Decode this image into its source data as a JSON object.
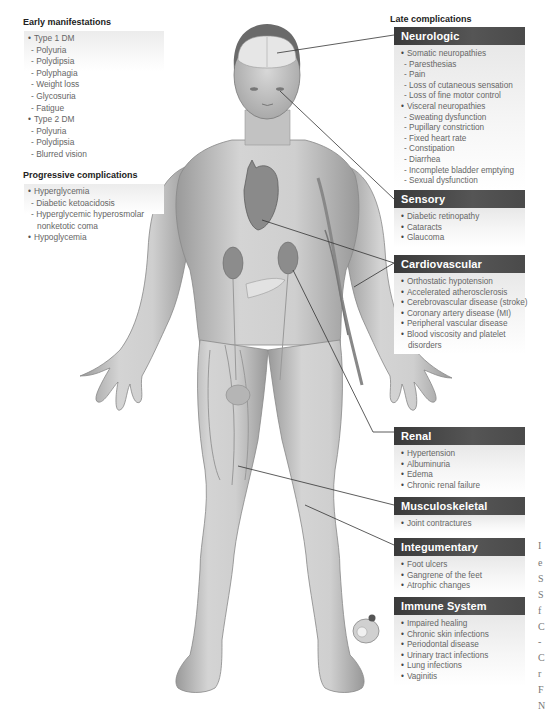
{
  "early": {
    "title": "Early manifestations",
    "items": [
      {
        "kind": "b",
        "text": "Type 1 DM"
      },
      {
        "kind": "d",
        "text": "Polyuria"
      },
      {
        "kind": "d",
        "text": "Polydipsia"
      },
      {
        "kind": "d",
        "text": "Polyphagia"
      },
      {
        "kind": "d",
        "text": "Weight loss"
      },
      {
        "kind": "d",
        "text": "Glycosuria"
      },
      {
        "kind": "d",
        "text": "Fatigue"
      },
      {
        "kind": "b",
        "text": "Type 2 DM"
      },
      {
        "kind": "d",
        "text": "Polyuria"
      },
      {
        "kind": "d",
        "text": "Polydipsia"
      },
      {
        "kind": "d",
        "text": "Blurred vision"
      }
    ]
  },
  "progressive": {
    "title": "Progressive complications",
    "items": [
      {
        "kind": "b",
        "text": "Hyperglycemia"
      },
      {
        "kind": "d",
        "text": "Diabetic ketoacidosis"
      },
      {
        "kind": "d",
        "text": "Hyperglycemic hyperosmolar"
      },
      {
        "kind": "cont",
        "text": "nonketotic coma"
      },
      {
        "kind": "b",
        "text": "Hypoglycemia"
      }
    ]
  },
  "late": {
    "title": "Late complications",
    "boxes": [
      {
        "id": "neurologic",
        "title": "Neurologic",
        "items": [
          {
            "kind": "b",
            "text": "Somatic neuropathies"
          },
          {
            "kind": "d",
            "text": "Paresthesias"
          },
          {
            "kind": "d",
            "text": "Pain"
          },
          {
            "kind": "d",
            "text": "Loss of cutaneous sensation"
          },
          {
            "kind": "d",
            "text": "Loss of fine motor control"
          },
          {
            "kind": "b",
            "text": "Visceral neuropathies"
          },
          {
            "kind": "d",
            "text": "Sweating dysfunction"
          },
          {
            "kind": "d",
            "text": "Pupillary constriction"
          },
          {
            "kind": "d",
            "text": "Fixed heart rate"
          },
          {
            "kind": "d",
            "text": "Constipation"
          },
          {
            "kind": "d",
            "text": "Diarrhea"
          },
          {
            "kind": "d",
            "text": "Incomplete bladder emptying"
          },
          {
            "kind": "d",
            "text": "Sexual dysfunction"
          }
        ]
      },
      {
        "id": "sensory",
        "title": "Sensory",
        "items": [
          {
            "kind": "b",
            "text": "Diabetic retinopathy"
          },
          {
            "kind": "b",
            "text": "Cataracts"
          },
          {
            "kind": "b",
            "text": "Glaucoma"
          }
        ]
      },
      {
        "id": "cardiovascular",
        "title": "Cardiovascular",
        "items": [
          {
            "kind": "b",
            "text": "Orthostatic hypotension"
          },
          {
            "kind": "b",
            "text": "Accelerated atherosclerosis"
          },
          {
            "kind": "b",
            "text": "Cerebrovascular disease (stroke)"
          },
          {
            "kind": "b",
            "text": "Coronary artery disease (MI)"
          },
          {
            "kind": "b",
            "text": "Peripheral vascular disease"
          },
          {
            "kind": "b",
            "text": "Blood viscosity and platelet"
          },
          {
            "kind": "cont",
            "text": "disorders"
          }
        ]
      },
      {
        "id": "renal",
        "title": "Renal",
        "items": [
          {
            "kind": "b",
            "text": "Hypertension"
          },
          {
            "kind": "b",
            "text": "Albuminuria"
          },
          {
            "kind": "b",
            "text": "Edema"
          },
          {
            "kind": "b",
            "text": "Chronic renal failure"
          }
        ]
      },
      {
        "id": "musculoskeletal",
        "title": "Musculoskeletal",
        "items": [
          {
            "kind": "b",
            "text": "Joint contractures"
          }
        ]
      },
      {
        "id": "integumentary",
        "title": "Integumentary",
        "items": [
          {
            "kind": "b",
            "text": "Foot ulcers"
          },
          {
            "kind": "b",
            "text": "Gangrene of the feet"
          },
          {
            "kind": "b",
            "text": "Atrophic changes"
          }
        ]
      },
      {
        "id": "immune",
        "title": "Immune System",
        "items": [
          {
            "kind": "b",
            "text": "Impaired healing"
          },
          {
            "kind": "b",
            "text": "Chronic skin infections"
          },
          {
            "kind": "b",
            "text": "Periodontal disease"
          },
          {
            "kind": "b",
            "text": "Urinary tract infections"
          },
          {
            "kind": "b",
            "text": "Lung infections"
          },
          {
            "kind": "b",
            "text": "Vaginitis"
          }
        ]
      }
    ]
  },
  "cropped_edge_text": [
    "I",
    "e",
    "S",
    "S",
    "f",
    "C",
    "-",
    "C",
    "r",
    "F",
    "N"
  ],
  "colors": {
    "header_bg": "#4a4a4a",
    "header_text": "#ffffff",
    "body_text": "#666666",
    "skin": "#c8c8c8",
    "leader_line": "#333333"
  }
}
